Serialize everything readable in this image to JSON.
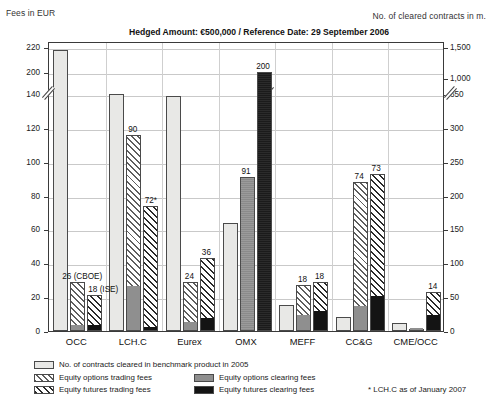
{
  "header": {
    "left_axis_caption": "Fees in EUR",
    "right_axis_caption": "No. of cleared contracts in m."
  },
  "chart_data": {
    "type": "bar",
    "title": "Hedged Amount: €500,000 / Reference Date: 29 September 2006",
    "xlabel": "",
    "ylabel": "Fees in EUR",
    "y2label": "No. of cleared contracts in m.",
    "grid": true,
    "legend_position": "bottom",
    "ylim": [
      0,
      220
    ],
    "y2lim": [
      0,
      1500
    ],
    "yticks": [
      "0",
      "20",
      "40",
      "60",
      "80",
      "100",
      "120",
      "140",
      "200",
      "220"
    ],
    "y2ticks": [
      "0",
      "50",
      "100",
      "150",
      "200",
      "250",
      "300",
      "350",
      "1,000",
      "1,500"
    ],
    "axis_break": {
      "left_between": [
        "140",
        "200"
      ],
      "right_between": [
        "350",
        "1,000"
      ]
    },
    "categories": [
      "OCC",
      "LCH.C",
      "Eurex",
      "OMX",
      "MEFF",
      "CC&G",
      "CME/OCC"
    ],
    "series": [
      {
        "name": "No. of contracts cleared in benchmark product in 2005",
        "key": "contracts",
        "axis": "right",
        "unit": "m.",
        "values": [
          1450,
          735,
          705,
          160,
          38,
          20,
          12
        ]
      },
      {
        "name": "Equity options trading fees",
        "key": "options_trading",
        "axis": "left",
        "values": [
          26,
          90,
          24,
          0,
          18,
          74,
          0
        ]
      },
      {
        "name": "Equity options clearing fees",
        "key": "options_clearing",
        "axis": "left",
        "values": [
          3,
          26,
          5,
          91,
          9,
          14,
          1
        ]
      },
      {
        "name": "Equity futures trading fees",
        "key": "futures_trading",
        "axis": "left",
        "values": [
          18,
          72,
          36,
          0,
          18,
          73,
          14
        ]
      },
      {
        "name": "Equity futures clearing fees",
        "key": "futures_clearing",
        "axis": "left",
        "values": [
          3,
          2,
          7,
          200,
          11,
          20,
          9
        ]
      }
    ],
    "bar_labels": [
      {
        "group": "OCC",
        "text": "26 (CBOE)",
        "value": 26
      },
      {
        "group": "OCC",
        "text": "18 (ISE)",
        "value": 18
      },
      {
        "group": "LCH.C",
        "text": "90",
        "value": 90
      },
      {
        "group": "LCH.C",
        "text": "72*",
        "value": 72
      },
      {
        "group": "LCH.C",
        "text": "48",
        "value": 48
      },
      {
        "group": "Eurex",
        "text": "24",
        "value": 24
      },
      {
        "group": "Eurex",
        "text": "36",
        "value": 36
      },
      {
        "group": "OMX",
        "text": "91",
        "value": 91
      },
      {
        "group": "OMX",
        "text": "200",
        "value": 200
      },
      {
        "group": "MEFF",
        "text": "18",
        "value": 18
      },
      {
        "group": "MEFF",
        "text": "18",
        "value": 18
      },
      {
        "group": "CC&G",
        "text": "74",
        "value": 74
      },
      {
        "group": "CC&G",
        "text": "73",
        "value": 73
      },
      {
        "group": "CME/OCC",
        "text": "14",
        "value": 14
      }
    ],
    "legend": [
      {
        "label": "No. of contracts cleared in benchmark product in 2005",
        "swatch": "contracts"
      },
      {
        "label": "Equity options trading fees",
        "swatch": "options_trading"
      },
      {
        "label": "Equity futures trading fees",
        "swatch": "futures_trading"
      },
      {
        "label": "Equity options clearing fees",
        "swatch": "options_clearing"
      },
      {
        "label": "Equity futures clearing fees",
        "swatch": "futures_clearing"
      }
    ],
    "footnote": "* LCH.C as of January 2007"
  },
  "colors": {
    "contracts": "#e8e8e6",
    "options_trading": "#5e5e5e",
    "options_clearing": "#8f8f8f",
    "futures_trading": "#2a2a2a",
    "futures_clearing": "#141414",
    "axis": "#3a3a3a",
    "grid": "#c9c9c9"
  }
}
